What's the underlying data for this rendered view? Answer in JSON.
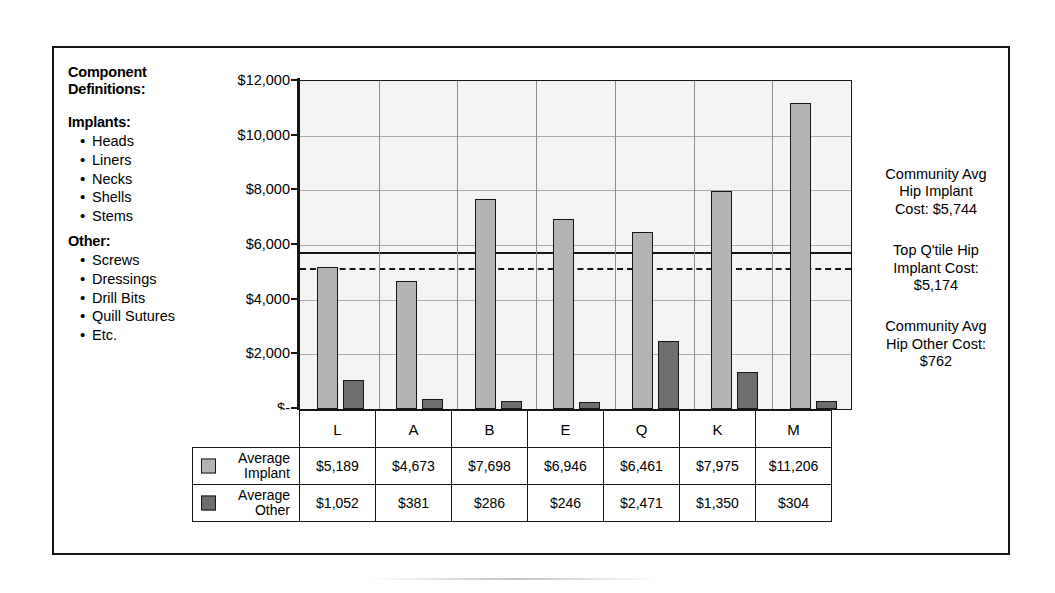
{
  "definitions": {
    "title_line1": "Component",
    "title_line2": "Definitions:",
    "implants_heading": "Implants:",
    "implants_items": [
      "Heads",
      "Liners",
      "Necks",
      "Shells",
      "Stems"
    ],
    "other_heading": "Other:",
    "other_items": [
      "Screws",
      "Dressings",
      "Drill Bits",
      "Quill Sutures",
      "Etc."
    ]
  },
  "annotations": [
    {
      "line1": "Community Avg",
      "line2": "Hip Implant",
      "line3": "Cost: $5,744"
    },
    {
      "line1": "Top Q'tile Hip",
      "line2": "Implant Cost:",
      "line3": "$5,174"
    },
    {
      "line1": "Community Avg",
      "line2": "Hip Other Cost:",
      "line3": "$762"
    }
  ],
  "table": {
    "row_implant_label_l1": "Average",
    "row_implant_label_l2": "Implant",
    "row_other_label_l1": "Average",
    "row_other_label_l2": "Other"
  },
  "colors": {
    "implant_fill": "#b4b4b4",
    "other_fill": "#6e6e6e",
    "outline": "#15161a",
    "plot_bg": "#f4f4f2",
    "gridline": "#a9a9a9"
  },
  "chart_data": {
    "type": "bar",
    "title": "",
    "xlabel": "",
    "ylabel": "",
    "categories": [
      "L",
      "A",
      "B",
      "E",
      "Q",
      "K",
      "M"
    ],
    "series": [
      {
        "name": "Average Implant",
        "values": [
          5189,
          4673,
          7698,
          6946,
          6461,
          7975,
          11206
        ],
        "labels": [
          "$5,189",
          "$4,673",
          "$7,698",
          "$6,946",
          "$6,461",
          "$7,975",
          "$11,206"
        ],
        "color": "#b4b4b4"
      },
      {
        "name": "Average Other",
        "values": [
          1052,
          381,
          286,
          246,
          2471,
          1350,
          304
        ],
        "labels": [
          "$1,052",
          "$381",
          "$286",
          "$246",
          "$2,471",
          "$1,350",
          "$304"
        ],
        "color": "#6e6e6e"
      }
    ],
    "ylim": [
      0,
      12000
    ],
    "ytick_values": [
      0,
      2000,
      4000,
      6000,
      8000,
      10000,
      12000
    ],
    "ytick_labels": [
      "$-",
      "$2,000",
      "$4,000",
      "$6,000",
      "$8,000",
      "$10,000",
      "$12,000"
    ],
    "grid": true,
    "legend_position": "table-below",
    "reference_lines": [
      {
        "name": "Community Avg Hip Implant Cost",
        "value": 5744,
        "style": "solid",
        "label": "Cost: $5,744"
      },
      {
        "name": "Top Q'tile Hip Implant Cost",
        "value": 5174,
        "style": "dashed",
        "label": "$5,174"
      }
    ]
  }
}
